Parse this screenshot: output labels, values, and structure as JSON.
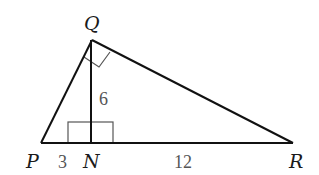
{
  "diagram": {
    "type": "right-triangle-with-altitude",
    "colors": {
      "lines": "#111111",
      "marks": "#555555",
      "labels": "#1a1a1a",
      "numbers": "#555555"
    },
    "vertices": {
      "P": {
        "label": "P",
        "x": 41,
        "y": 143
      },
      "Q": {
        "label": "Q",
        "x": 92,
        "y": 40
      },
      "R": {
        "label": "R",
        "x": 293,
        "y": 143
      },
      "N": {
        "label": "N",
        "x": 91,
        "y": 143
      }
    },
    "segments": [
      {
        "from": "P",
        "to": "Q"
      },
      {
        "from": "Q",
        "to": "R"
      },
      {
        "from": "P",
        "to": "R"
      },
      {
        "from": "Q",
        "to": "N"
      }
    ],
    "measurements": {
      "PN": "3",
      "NR": "12",
      "QN": "6"
    },
    "right_angles": [
      "Q",
      "N"
    ]
  }
}
